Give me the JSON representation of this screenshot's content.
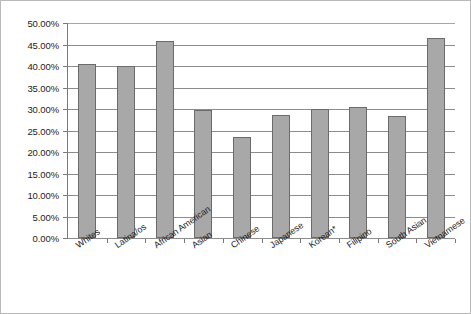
{
  "chart_data": {
    "type": "bar",
    "title": "",
    "subtitle": "",
    "xlabel": "",
    "ylabel": "",
    "categories": [
      "Whites",
      "Latina/os",
      "African American",
      "Asian",
      "Chinese",
      "Japanese",
      "Korean*",
      "Filipino",
      "South Asian",
      "Vietnamese"
    ],
    "values": [
      40.5,
      40.1,
      45.9,
      29.8,
      23.4,
      28.7,
      30.0,
      30.5,
      28.4,
      46.4
    ],
    "value_format": "percent",
    "ylim": [
      0,
      50
    ],
    "ytick_values": [
      0,
      5,
      10,
      15,
      20,
      25,
      30,
      35,
      40,
      45,
      50
    ],
    "ytick_labels": [
      "0.00%",
      "5.00%",
      "10.00%",
      "15.00%",
      "20.00%",
      "25.00%",
      "30.00%",
      "35.00%",
      "40.00%",
      "45.00%",
      "50.00%"
    ],
    "grid": "horizontal",
    "legend": "none",
    "legend_position": "none",
    "data_labels": false,
    "xtick_label_rotation": -35,
    "colors": {
      "bar_fill": "#a8a8a8",
      "bar_border": "#6b6b6b",
      "gridline": "#8c8c8c",
      "axis": "#7a7a7a",
      "frame_border": "#b9b9b9",
      "background": "#ffffff",
      "text": "#1c1c1c"
    }
  }
}
